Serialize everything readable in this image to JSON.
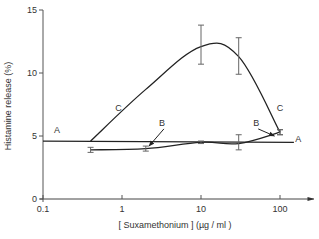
{
  "chart_data": {
    "type": "line",
    "title": "",
    "xlabel": "[ Suxamethonium ] (µg / ml )",
    "ylabel": "Histamine release (%)",
    "xscale": "log",
    "xlim": [
      0.1,
      200
    ],
    "ylim": [
      0,
      15
    ],
    "x_ticks": [
      0.1,
      1,
      10,
      100
    ],
    "x_tick_labels": [
      "0.1",
      "1",
      "10",
      "100"
    ],
    "y_ticks": [
      0,
      5,
      10,
      15
    ],
    "y_tick_labels": [
      "0",
      "5",
      "10",
      "15"
    ],
    "grid": false,
    "legend": "inline curve labels (A, B, C)",
    "series": [
      {
        "name": "A",
        "style": "horizontal baseline",
        "x": [
          0.1,
          150
        ],
        "values": [
          4.6,
          4.5
        ]
      },
      {
        "name": "B",
        "x": [
          0.4,
          2,
          10,
          30,
          100
        ],
        "values": [
          3.9,
          4.0,
          4.5,
          4.4,
          5.3
        ],
        "error_low": [
          3.7,
          3.8,
          4.4,
          3.9,
          5.1
        ],
        "error_high": [
          4.1,
          4.2,
          4.6,
          5.1,
          5.5
        ]
      },
      {
        "name": "C",
        "x": [
          0.4,
          2,
          10,
          30,
          100
        ],
        "values": [
          4.6,
          8.7,
          12.1,
          11.3,
          5.3
        ],
        "error_low": [
          4.6,
          8.7,
          10.7,
          9.9,
          5.1
        ],
        "error_high": [
          4.6,
          8.7,
          13.8,
          12.8,
          5.5
        ]
      }
    ],
    "annotations": [
      {
        "text": "A",
        "x": 0.15,
        "y": 5.2
      },
      {
        "text": "A",
        "x": 170,
        "y": 4.5
      },
      {
        "text": "B",
        "x": 3.2,
        "y": 5.8,
        "arrow_to": [
          2.2,
          4.2
        ]
      },
      {
        "text": "B",
        "x": 50,
        "y": 5.8,
        "arrow_to": [
          85,
          5.0
        ]
      },
      {
        "text": "C",
        "x": 0.9,
        "y": 7.0
      },
      {
        "text": "C",
        "x": 100,
        "y": 7.0
      }
    ]
  }
}
